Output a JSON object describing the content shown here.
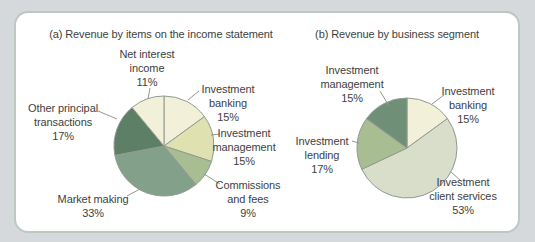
{
  "figure": {
    "page_bg": "#d5d9dc",
    "panel_bg": "#ffffff",
    "panel_border_color": "#bdc8c0",
    "text_color": "#3d3f3e",
    "leader_line_color": "#8f9892",
    "slice_stroke_color": "#919b92"
  },
  "chart_data": [
    {
      "type": "pie",
      "title": "(a) Revenue by items on the income statement",
      "unit": "percent",
      "direction": "clockwise",
      "start": "12-oclock",
      "legend_position": "labels-around-pie",
      "slices": [
        {
          "label": "Investment banking",
          "pct": 15,
          "display": "15%",
          "label_lines": [
            "Investment",
            "banking",
            "15%"
          ],
          "color": "#f2f0d9"
        },
        {
          "label": "Investment management",
          "pct": 15,
          "display": "15%",
          "label_lines": [
            "Investment",
            "management",
            "15%"
          ],
          "color": "#dfe2b0"
        },
        {
          "label": "Commissions and fees",
          "pct": 9,
          "display": "9%",
          "label_lines": [
            "Commissions",
            "and fees",
            "9%"
          ],
          "color": "#a9bd92"
        },
        {
          "label": "Market making",
          "pct": 33,
          "display": "33%",
          "label_lines": [
            "Market making",
            "33%"
          ],
          "color": "#83a08a"
        },
        {
          "label": "Other principal transactions",
          "pct": 17,
          "display": "17%",
          "label_lines": [
            "Other principal",
            "transactions",
            "17%"
          ],
          "color": "#5c7f66"
        },
        {
          "label": "Net interest income",
          "pct": 11,
          "display": "11%",
          "label_lines": [
            "Net interest",
            "income",
            "11%"
          ],
          "color": "#f2f0d9"
        }
      ]
    },
    {
      "type": "pie",
      "title": "(b) Revenue by business segment",
      "unit": "percent",
      "direction": "clockwise",
      "start": "12-oclock",
      "legend_position": "labels-around-pie",
      "slices": [
        {
          "label": "Investment banking",
          "pct": 15,
          "display": "15%",
          "label_lines": [
            "Investment",
            "banking",
            "15%"
          ],
          "color": "#f2f0d9"
        },
        {
          "label": "Investment client services",
          "pct": 53,
          "display": "53%",
          "label_lines": [
            "Investment",
            "client services",
            "53%"
          ],
          "color": "#d9decb"
        },
        {
          "label": "Investment lending",
          "pct": 17,
          "display": "17%",
          "label_lines": [
            "Investment",
            "lending",
            "17%"
          ],
          "color": "#a9bd92"
        },
        {
          "label": "Investment management",
          "pct": 15,
          "display": "15%",
          "label_lines": [
            "Investment",
            "management",
            "15%"
          ],
          "color": "#6f9077"
        }
      ]
    }
  ]
}
